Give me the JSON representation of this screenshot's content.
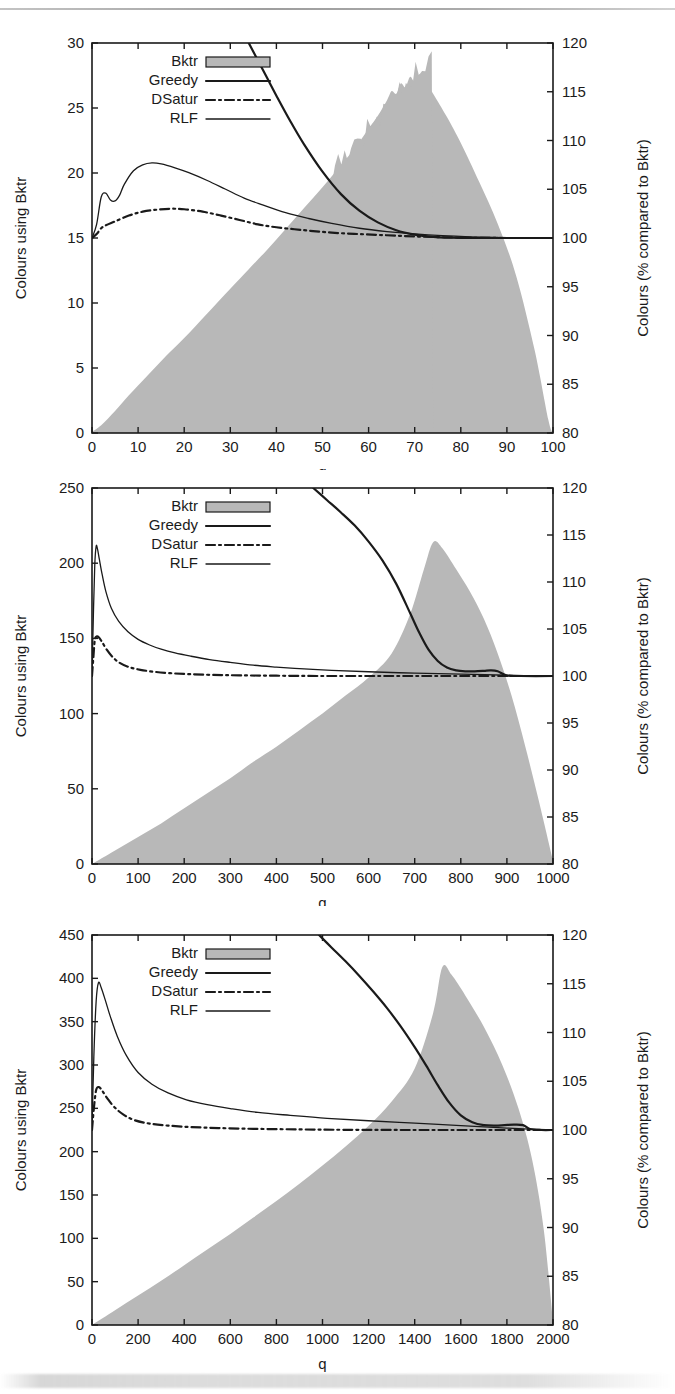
{
  "figure": {
    "kind": "scanned-figure",
    "page_rule": true,
    "panel_count": 3
  },
  "common": {
    "ylabel_left": "Colours using Bktr",
    "ylabel_right": "Colours (% compared to Bktr)",
    "xlabel": "q",
    "legend": [
      {
        "label": "Bktr",
        "style": "filled-box",
        "color": "#b8b8b8"
      },
      {
        "label": "Greedy",
        "style": "solid-thick",
        "color": "#1a1a1a"
      },
      {
        "label": "DSatur",
        "style": "dash-dot",
        "color": "#1a1a1a"
      },
      {
        "label": "RLF",
        "style": "solid-thin",
        "color": "#1a1a1a"
      }
    ],
    "fill_color": "#b8b8b8",
    "line_color": "#1a1a1a",
    "frame_color": "#1a1a1a"
  },
  "chart_data": [
    {
      "type": "area",
      "panel": 1,
      "title": "",
      "xlabel": "q",
      "ylabel": "Colours using Bktr",
      "ylabel_right": "Colours (% compared to Bktr)",
      "xlim": [
        0,
        100
      ],
      "ylim": [
        0,
        30
      ],
      "ylim_right": [
        80,
        120
      ],
      "xticks": [
        0,
        10,
        20,
        30,
        40,
        50,
        60,
        70,
        80,
        90,
        100
      ],
      "yticks": [
        0,
        5,
        10,
        15,
        20,
        25,
        30
      ],
      "yticks_right": [
        80,
        85,
        90,
        95,
        100,
        105,
        110,
        115,
        120
      ],
      "grid": false,
      "legend_position": "top-left",
      "series": [
        {
          "name": "Bktr",
          "axis": "left",
          "style": "filled-area",
          "x": [
            0,
            2,
            5,
            8,
            12,
            16,
            20,
            25,
            30,
            34,
            38,
            42,
            46,
            50,
            54,
            57,
            60,
            62,
            64,
            65,
            66,
            67,
            68,
            69,
            70,
            71,
            72,
            74,
            77,
            80,
            84,
            88,
            92,
            96,
            99,
            100
          ],
          "values": [
            0.1,
            0.6,
            1.7,
            2.9,
            4.4,
            5.9,
            7.3,
            9.2,
            11.1,
            12.6,
            14.1,
            15.7,
            17.3,
            18.9,
            20.6,
            21.9,
            23.4,
            24.4,
            25.6,
            26.3,
            26.1,
            26.9,
            26.6,
            27.4,
            27.0,
            27.6,
            27.2,
            26.1,
            24.3,
            22.3,
            19.3,
            16.1,
            12.1,
            6.4,
            1.0,
            0.0
          ]
        },
        {
          "name": "Greedy",
          "axis": "right",
          "style": "solid-thick",
          "x": [
            34,
            36,
            38,
            40,
            43,
            46,
            50,
            54,
            58,
            62,
            66,
            70,
            74,
            78,
            82,
            88,
            94,
            100
          ],
          "values": [
            120.0,
            118.2,
            116.4,
            114.6,
            112.0,
            109.6,
            106.8,
            104.5,
            102.8,
            101.6,
            100.8,
            100.35,
            100.12,
            100.03,
            100.0,
            100.0,
            100.0,
            100.0
          ]
        },
        {
          "name": "DSatur",
          "axis": "right",
          "style": "dash-dot",
          "x": [
            0,
            1,
            2,
            3,
            5,
            8,
            11,
            14,
            17,
            20,
            24,
            28,
            32,
            36,
            40,
            46,
            52,
            58,
            64,
            70,
            76,
            82,
            90,
            100
          ],
          "values": [
            100.0,
            100.4,
            101.0,
            101.3,
            101.7,
            102.3,
            102.7,
            102.9,
            103.0,
            102.95,
            102.7,
            102.3,
            101.85,
            101.4,
            101.1,
            100.8,
            100.55,
            100.4,
            100.28,
            100.16,
            100.08,
            100.03,
            100.0,
            100.0
          ]
        },
        {
          "name": "RLF",
          "axis": "right",
          "style": "solid-thin",
          "x": [
            0,
            1,
            2,
            3,
            4,
            5,
            6,
            7,
            9,
            11,
            13,
            15,
            18,
            21,
            25,
            29,
            33,
            37,
            42,
            47,
            52,
            58,
            64,
            70,
            76,
            82,
            88,
            94,
            100
          ],
          "values": [
            100.0,
            101.4,
            104.2,
            104.6,
            103.9,
            103.8,
            104.4,
            105.5,
            106.9,
            107.5,
            107.7,
            107.6,
            107.2,
            106.7,
            105.9,
            105.0,
            104.1,
            103.4,
            102.6,
            102.0,
            101.5,
            101.0,
            100.66,
            100.42,
            100.24,
            100.12,
            100.05,
            100.0,
            100.0
          ]
        }
      ]
    },
    {
      "type": "area",
      "panel": 2,
      "title": "",
      "xlabel": "q",
      "ylabel": "Colours using Bktr",
      "ylabel_right": "Colours (% compared to Bktr)",
      "xlim": [
        0,
        1000
      ],
      "ylim": [
        0,
        250
      ],
      "ylim_right": [
        80,
        120
      ],
      "xticks": [
        0,
        100,
        200,
        300,
        400,
        500,
        600,
        700,
        800,
        900,
        1000
      ],
      "yticks": [
        0,
        50,
        100,
        150,
        200,
        250
      ],
      "yticks_right": [
        80,
        85,
        90,
        95,
        100,
        105,
        110,
        115,
        120
      ],
      "grid": false,
      "legend_position": "top-left",
      "series": [
        {
          "name": "Bktr",
          "axis": "left",
          "style": "filled-area",
          "x": [
            0,
            50,
            100,
            150,
            200,
            250,
            300,
            350,
            400,
            450,
            500,
            550,
            600,
            650,
            690,
            720,
            740,
            760,
            790,
            820,
            850,
            880,
            910,
            940,
            970,
            1000
          ],
          "values": [
            0,
            9,
            18,
            27,
            37,
            47,
            57,
            68,
            78,
            89,
            100,
            112,
            124,
            140,
            166,
            196,
            214,
            210,
            196,
            181,
            163,
            140,
            112,
            78,
            41,
            2
          ]
        },
        {
          "name": "Greedy",
          "axis": "right",
          "style": "solid-thick",
          "x": [
            480,
            510,
            540,
            570,
            600,
            630,
            660,
            690,
            710,
            730,
            750,
            770,
            790,
            810,
            830,
            850,
            865,
            880,
            900,
            930,
            1000
          ],
          "values": [
            120.0,
            118.7,
            117.4,
            116.0,
            114.3,
            112.3,
            109.8,
            106.7,
            104.6,
            102.8,
            101.6,
            100.9,
            100.6,
            100.5,
            100.5,
            100.55,
            100.6,
            100.5,
            100.05,
            100.0,
            100.0
          ]
        },
        {
          "name": "DSatur",
          "axis": "right",
          "style": "dash-dot",
          "x": [
            0,
            3,
            6,
            10,
            15,
            22,
            32,
            45,
            60,
            80,
            105,
            135,
            170,
            210,
            260,
            320,
            400,
            500,
            600,
            700,
            800,
            900,
            1000
          ],
          "values": [
            100.0,
            102.0,
            103.8,
            104.2,
            104.1,
            103.6,
            102.8,
            102.0,
            101.4,
            100.95,
            100.66,
            100.45,
            100.3,
            100.2,
            100.12,
            100.07,
            100.03,
            100.0,
            100.0,
            100.0,
            100.0,
            100.0,
            100.0
          ]
        },
        {
          "name": "RLF",
          "axis": "right",
          "style": "solid-thin",
          "x": [
            0,
            3,
            6,
            9,
            12,
            16,
            22,
            30,
            42,
            58,
            78,
            100,
            125,
            150,
            180,
            215,
            255,
            300,
            350,
            400,
            460,
            520,
            600,
            700,
            800,
            900,
            1000
          ],
          "values": [
            100.0,
            106.5,
            111.8,
            113.8,
            113.5,
            112.4,
            110.8,
            109.0,
            107.2,
            105.8,
            104.7,
            103.9,
            103.3,
            102.85,
            102.45,
            102.1,
            101.75,
            101.45,
            101.15,
            100.95,
            100.75,
            100.6,
            100.45,
            100.3,
            100.2,
            100.08,
            100.0
          ]
        }
      ]
    },
    {
      "type": "area",
      "panel": 3,
      "title": "",
      "xlabel": "q",
      "ylabel": "Colours using Bktr",
      "ylabel_right": "Colours (% compared to Bktr)",
      "xlim": [
        0,
        2000
      ],
      "ylim": [
        0,
        450
      ],
      "ylim_right": [
        80,
        120
      ],
      "xticks": [
        0,
        200,
        400,
        600,
        800,
        1000,
        1200,
        1400,
        1600,
        1800,
        2000
      ],
      "yticks": [
        0,
        50,
        100,
        150,
        200,
        250,
        300,
        350,
        400,
        450
      ],
      "yticks_right": [
        80,
        85,
        90,
        95,
        100,
        105,
        110,
        115,
        120
      ],
      "grid": false,
      "legend_position": "top-left",
      "series": [
        {
          "name": "Bktr",
          "axis": "left",
          "style": "filled-area",
          "x": [
            0,
            100,
            200,
            300,
            400,
            500,
            600,
            700,
            800,
            900,
            1000,
            1100,
            1200,
            1300,
            1400,
            1480,
            1520,
            1560,
            1620,
            1700,
            1780,
            1850,
            1910,
            1960,
            2000
          ],
          "values": [
            0,
            17,
            34,
            51,
            69,
            87,
            105,
            124,
            143,
            163,
            184,
            206,
            230,
            258,
            296,
            360,
            413,
            404,
            380,
            344,
            300,
            250,
            190,
            110,
            3
          ]
        },
        {
          "name": "Greedy",
          "axis": "right",
          "style": "solid-thick",
          "x": [
            985,
            1040,
            1100,
            1160,
            1220,
            1280,
            1340,
            1400,
            1450,
            1500,
            1550,
            1600,
            1650,
            1700,
            1750,
            1790,
            1830,
            1870,
            1900,
            1950,
            2000
          ],
          "values": [
            120.0,
            118.7,
            117.3,
            115.8,
            114.2,
            112.5,
            110.6,
            108.5,
            106.6,
            104.6,
            102.8,
            101.5,
            100.8,
            100.5,
            100.45,
            100.5,
            100.55,
            100.5,
            100.1,
            100.0,
            100.0
          ]
        },
        {
          "name": "DSatur",
          "axis": "right",
          "style": "dash-dot",
          "x": [
            0,
            8,
            18,
            30,
            45,
            65,
            95,
            135,
            185,
            250,
            330,
            430,
            550,
            700,
            900,
            1100,
            1400,
            1700,
            2000
          ],
          "values": [
            100.0,
            102.2,
            104.1,
            104.4,
            104.0,
            103.3,
            102.4,
            101.6,
            101.0,
            100.66,
            100.45,
            100.3,
            100.2,
            100.12,
            100.06,
            100.02,
            100.0,
            100.0,
            100.0
          ]
        },
        {
          "name": "RLF",
          "axis": "right",
          "style": "solid-thin",
          "x": [
            0,
            8,
            18,
            28,
            40,
            58,
            80,
            110,
            150,
            200,
            260,
            330,
            410,
            500,
            600,
            720,
            860,
            1020,
            1200,
            1400,
            1600,
            1800,
            2000
          ],
          "values": [
            100.0,
            107.5,
            113.2,
            115.1,
            114.6,
            113.3,
            111.6,
            109.6,
            107.6,
            105.9,
            104.7,
            103.8,
            103.1,
            102.6,
            102.2,
            101.8,
            101.5,
            101.2,
            100.95,
            100.7,
            100.45,
            100.2,
            100.0
          ]
        }
      ]
    }
  ]
}
